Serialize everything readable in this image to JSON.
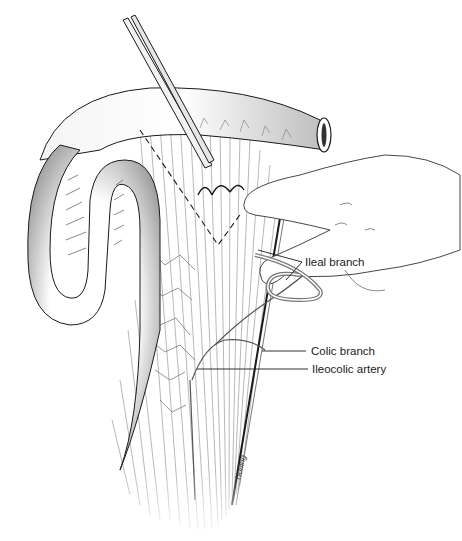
{
  "figure": {
    "labels": {
      "ileal_branch": "Ileal branch",
      "colic_branch": "Colic branch",
      "ileocolic_artery": "Ileocolic artery"
    },
    "signature": "Hofling",
    "colors": {
      "line": "#1a1a1a",
      "shade": "#8a8a8a",
      "light_shade": "#cfcfcf",
      "background": "#ffffff"
    }
  }
}
